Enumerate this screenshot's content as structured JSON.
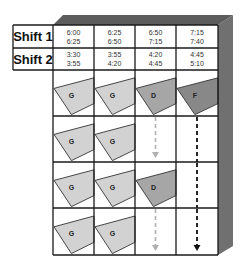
{
  "diagram": {
    "type": "shift schedule grid with process shapes",
    "colors": {
      "grid_line": "#1a1a1a",
      "side_shadow": "#6e6e6e",
      "top_shadow": "#5a5a5a",
      "shape_G": "#d2d2d2",
      "shape_D": "#a6a6a6",
      "shape_F": "#888888",
      "arrow_light": "#b0b0b0",
      "arrow_dark": "#111111"
    },
    "shifts": [
      {
        "label": "Shift 1",
        "times": [
          [
            "6:00",
            "6:25"
          ],
          [
            "6:25",
            "6:50"
          ],
          [
            "6:50",
            "7:15"
          ],
          [
            "7:15",
            "7:40"
          ]
        ]
      },
      {
        "label": "Shift 2",
        "times": [
          [
            "3:30",
            "3:55"
          ],
          [
            "3:55",
            "4:20"
          ],
          [
            "4:20",
            "4:45"
          ],
          [
            "4:45",
            "5:10"
          ]
        ]
      }
    ],
    "grid": [
      [
        {
          "type": "shape",
          "label": "G"
        },
        {
          "type": "shape",
          "label": "G"
        },
        {
          "type": "shape",
          "label": "D"
        },
        {
          "type": "shape",
          "label": "F"
        }
      ],
      [
        {
          "type": "shape",
          "label": "G"
        },
        {
          "type": "shape",
          "label": "G"
        },
        {
          "type": "arrow",
          "style": "light",
          "head": true
        },
        {
          "type": "arrow",
          "style": "dark",
          "head": false
        }
      ],
      [
        {
          "type": "shape",
          "label": "G"
        },
        {
          "type": "shape",
          "label": "G"
        },
        {
          "type": "shape",
          "label": "D"
        },
        {
          "type": "arrow",
          "style": "dark",
          "head": false
        }
      ],
      [
        {
          "type": "shape",
          "label": "G"
        },
        {
          "type": "shape",
          "label": "G"
        },
        {
          "type": "arrow",
          "style": "light",
          "head": true
        },
        {
          "type": "arrow",
          "style": "dark",
          "head": true
        }
      ]
    ]
  }
}
